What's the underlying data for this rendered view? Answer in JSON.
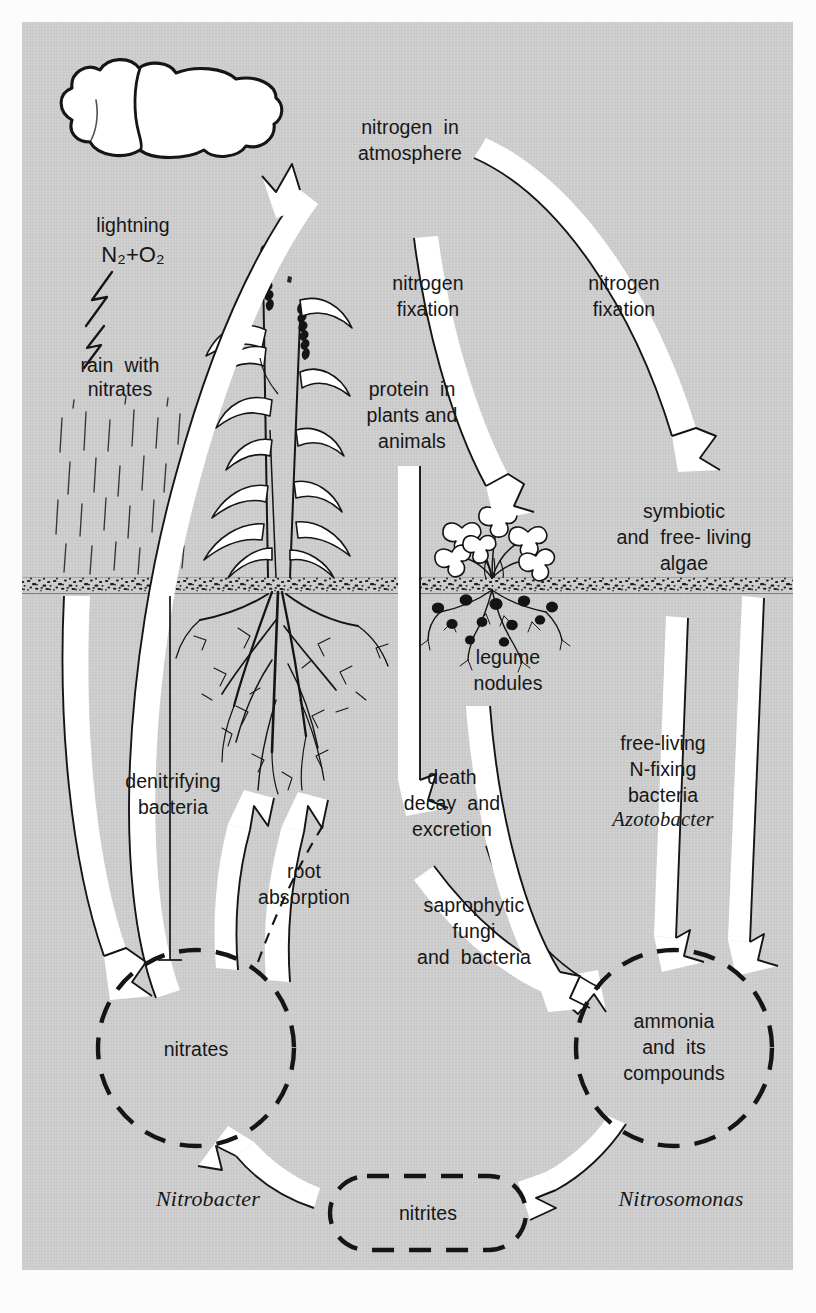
{
  "diagram": {
    "panel_color": "#cdcdcd",
    "ink_color": "#161616",
    "arrow_fill": "#ffffff",
    "soil_color": "#2a2a2a"
  },
  "labels": {
    "lightning": "lightning",
    "formula": "N₂+O₂",
    "rain_with": "rain  with",
    "rain_nitrates": "nitrates",
    "nitrogen_atmosphere_1": "nitrogen  in",
    "nitrogen_atmosphere_2": "atmosphere",
    "fixation_left_1": "nitrogen",
    "fixation_left_2": "fixation",
    "fixation_right_1": "nitrogen",
    "fixation_right_2": "fixation",
    "protein_1": "protein  in",
    "protein_2": "plants and",
    "protein_3": "animals",
    "symbiotic_1": "symbiotic",
    "symbiotic_2": "and  free- living",
    "symbiotic_3": "algae",
    "legume_1": "legume",
    "legume_2": "nodules",
    "denitrifying_1": "denitrifying",
    "denitrifying_2": "bacteria",
    "death_1": "death",
    "death_2": "decay  and",
    "death_3": "excretion",
    "freeliving_1": "free-living",
    "freeliving_2": "N-fixing",
    "freeliving_3": "bacteria",
    "azotobacter": "Azotobacter",
    "root_1": "root",
    "root_2": "absorption",
    "saprophytic_1": "saprophytic",
    "saprophytic_2": "fungi",
    "saprophytic_3": "and  bacteria",
    "nitrates_pool": "nitrates",
    "ammonia_1": "ammonia",
    "ammonia_2": "and  its",
    "ammonia_3": "compounds",
    "nitrobacter": "Nitrobacter",
    "nitrites_pool": "nitrites",
    "nitrosomonas": "Nitrosomonas"
  },
  "nodes": [
    {
      "id": "atmosphere",
      "label": "nitrogen in atmosphere",
      "shape": "text"
    },
    {
      "id": "protein",
      "label": "protein in plants and animals",
      "shape": "text"
    },
    {
      "id": "symbiotic-algae",
      "label": "symbiotic and free-living algae",
      "shape": "text"
    },
    {
      "id": "death-decay",
      "label": "death decay and excretion",
      "shape": "text"
    },
    {
      "id": "nitrates",
      "label": "nitrates",
      "shape": "dashed-circle"
    },
    {
      "id": "ammonia",
      "label": "ammonia and its compounds",
      "shape": "dashed-circle"
    },
    {
      "id": "nitrites",
      "label": "nitrites",
      "shape": "dashed-rounded-rect"
    }
  ],
  "flows": [
    {
      "from": "nitrates",
      "to": "atmosphere",
      "label": "denitrifying bacteria"
    },
    {
      "from": "atmosphere",
      "to": "legume-nodules",
      "label": "nitrogen fixation"
    },
    {
      "from": "atmosphere",
      "to": "symbiotic-algae",
      "label": "nitrogen fixation"
    },
    {
      "from": "protein",
      "to": "death-decay",
      "label": ""
    },
    {
      "from": "death-decay",
      "to": "ammonia",
      "label": "saprophytic fungi and bacteria"
    },
    {
      "from": "nitrates",
      "to": "protein",
      "label": "root absorption"
    },
    {
      "from": "legume-nodules",
      "to": "ammonia",
      "label": ""
    },
    {
      "from": "symbiotic-algae",
      "to": "ammonia",
      "label": "free-living N-fixing bacteria Azotobacter"
    },
    {
      "from": "ammonia",
      "to": "nitrites",
      "label": "Nitrosomonas"
    },
    {
      "from": "nitrites",
      "to": "nitrates",
      "label": "Nitrobacter"
    },
    {
      "from": "cloud",
      "to": "nitrates",
      "label": "rain with nitrates"
    }
  ],
  "illustrations": [
    {
      "name": "cloud",
      "note": "white cumulus cloud, top-left"
    },
    {
      "name": "lightning-bolt",
      "note": "zig-zag bolt below cloud"
    },
    {
      "name": "rain-streaks",
      "note": "short vertical dashes"
    },
    {
      "name": "grass-plant",
      "note": "grass with seed heads and deep branching roots"
    },
    {
      "name": "legume-plant",
      "note": "clover-like legume with dark root nodules"
    },
    {
      "name": "soil-band",
      "note": "speckled horizontal ground line"
    }
  ]
}
